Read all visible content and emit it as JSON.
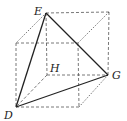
{
  "diagram": {
    "type": "cube-with-tetrahedron",
    "labels": {
      "E": "E",
      "H": "H",
      "G": "G",
      "D": "D"
    },
    "colors": {
      "solid_edge": "#222222",
      "dashed_edge": "#444444",
      "background": "#ffffff"
    }
  }
}
